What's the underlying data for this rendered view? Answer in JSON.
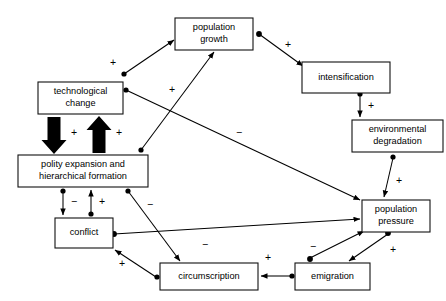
{
  "diagram": {
    "type": "causal-loop-diagram",
    "width": 446,
    "height": 301,
    "background_color": "#ffffff",
    "line_color": "#000000",
    "node_fill": "#ffffff",
    "nodes": [
      {
        "id": "population_growth",
        "label_line1": "population",
        "label_line2": "growth",
        "x": 175,
        "y": 18,
        "w": 78,
        "h": 32
      },
      {
        "id": "technological_change",
        "label_line1": "technological",
        "label_line2": "change",
        "x": 38,
        "y": 82,
        "w": 85,
        "h": 32
      },
      {
        "id": "intensification",
        "label_line1": "intensification",
        "label_line2": "",
        "x": 302,
        "y": 62,
        "w": 88,
        "h": 31
      },
      {
        "id": "environmental_degradation",
        "label_line1": "environmental",
        "label_line2": "degradation",
        "x": 352,
        "y": 120,
        "w": 91,
        "h": 32
      },
      {
        "id": "polity_expansion",
        "label_line1": "polity expansion and",
        "label_line2": "hierarchical formation",
        "x": 18,
        "y": 155,
        "w": 130,
        "h": 32
      },
      {
        "id": "population_pressure",
        "label_line1": "population",
        "label_line2": "pressure",
        "x": 362,
        "y": 200,
        "w": 68,
        "h": 32
      },
      {
        "id": "conflict",
        "label_line1": "conflict",
        "label_line2": "",
        "x": 55,
        "y": 218,
        "w": 58,
        "h": 30
      },
      {
        "id": "circumscription",
        "label_line1": "circumscription",
        "label_line2": "",
        "x": 160,
        "y": 263,
        "w": 98,
        "h": 27
      },
      {
        "id": "emigration",
        "label_line1": "emigration",
        "label_line2": "",
        "x": 295,
        "y": 263,
        "w": 75,
        "h": 27
      }
    ],
    "links": [
      {
        "id": "tech_to_popgrowth",
        "from": "technological_change",
        "to": "population_growth",
        "sign": "+",
        "sign_x": 113,
        "sign_y": 63,
        "x1": 124,
        "y1": 74,
        "x2": 174,
        "y2": 40
      },
      {
        "id": "polity_to_popgrowth",
        "from": "polity_expansion",
        "to": "population_growth",
        "sign": "+",
        "sign_x": 172,
        "sign_y": 90,
        "x1": 141,
        "y1": 150,
        "x2": 214,
        "y2": 52
      },
      {
        "id": "popgrowth_to_intensification",
        "from": "population_growth",
        "to": "intensification",
        "sign": "+",
        "sign_x": 288,
        "sign_y": 45,
        "x1": 259,
        "y1": 34,
        "x2": 303,
        "y2": 66
      },
      {
        "id": "intensification_to_envdeg",
        "from": "intensification",
        "to": "environmental_degradation",
        "sign": "+",
        "sign_x": 371,
        "sign_y": 106,
        "x1": 360,
        "y1": 95,
        "x2": 360,
        "y2": 118
      },
      {
        "id": "envdeg_to_poppressure",
        "from": "environmental_degradation",
        "to": "population_pressure",
        "sign": "+",
        "sign_x": 397,
        "sign_y": 181,
        "x1": 393,
        "y1": 158,
        "x2": 383,
        "y2": 198
      },
      {
        "id": "tech_to_poppressure",
        "from": "technological_change",
        "to": "population_pressure",
        "sign": "−",
        "sign_x": 239,
        "sign_y": 133,
        "x1": 126,
        "y1": 90,
        "x2": 361,
        "y2": 200
      },
      {
        "id": "polity_to_circumscription",
        "from": "polity_expansion",
        "to": "circumscription",
        "sign": "−",
        "sign_x": 150,
        "sign_y": 205,
        "x1": 128,
        "y1": 191,
        "x2": 180,
        "y2": 261
      },
      {
        "id": "conflict_to_poppressure",
        "from": "conflict",
        "to": "population_pressure",
        "sign": "−",
        "sign_x": 205,
        "sign_y": 244,
        "x1": 114,
        "y1": 234,
        "x2": 360,
        "y2": 219
      },
      {
        "id": "circumscription_to_conflict",
        "from": "circumscription",
        "to": "conflict",
        "sign": "+",
        "sign_x": 122,
        "sign_y": 264,
        "x1": 156,
        "y1": 277,
        "x2": 114,
        "y2": 249
      },
      {
        "id": "emigration_to_circumscription",
        "from": "emigration",
        "to": "circumscription",
        "sign": "+",
        "sign_x": 268,
        "sign_y": 258,
        "x1": 291,
        "y1": 276,
        "x2": 260,
        "y2": 276
      },
      {
        "id": "poppressure_to_emigration",
        "from": "population_pressure",
        "to": "emigration",
        "sign": "+",
        "sign_x": 392,
        "sign_y": 250,
        "x1": 388,
        "y1": 234,
        "x2": 348,
        "y2": 261
      },
      {
        "id": "emigration_to_poppressure",
        "from": "emigration",
        "to": "population_pressure",
        "sign": "−",
        "sign_x": 313,
        "sign_y": 247,
        "x1": 310,
        "y1": 258,
        "x2": 364,
        "y2": 231
      },
      {
        "id": "polity_to_conflict",
        "from": "polity_expansion",
        "to": "conflict",
        "sign": "−",
        "sign_x": 74,
        "sign_y": 202,
        "x1": 63,
        "y1": 191,
        "x2": 63,
        "y2": 216
      },
      {
        "id": "conflict_to_polity",
        "from": "conflict",
        "to": "polity_expansion",
        "sign": "+",
        "sign_x": 102,
        "sign_y": 202,
        "x1": 91,
        "y1": 214,
        "x2": 91,
        "y2": 190
      }
    ],
    "block_arrows": [
      {
        "id": "tech_to_polity_block",
        "from": "technological_change",
        "to": "polity_expansion",
        "direction": "down",
        "sign": "+",
        "sign_x": 74,
        "sign_y": 133,
        "cx": 54,
        "top": 117,
        "bottom": 154,
        "shaft_w": 13,
        "head_w": 25,
        "head_h": 14
      },
      {
        "id": "polity_to_tech_block",
        "from": "polity_expansion",
        "to": "technological_change",
        "direction": "up",
        "sign": "+",
        "sign_x": 119,
        "sign_y": 133,
        "cx": 99,
        "top": 116,
        "bottom": 153,
        "shaft_w": 13,
        "head_w": 25,
        "head_h": 14
      }
    ]
  }
}
